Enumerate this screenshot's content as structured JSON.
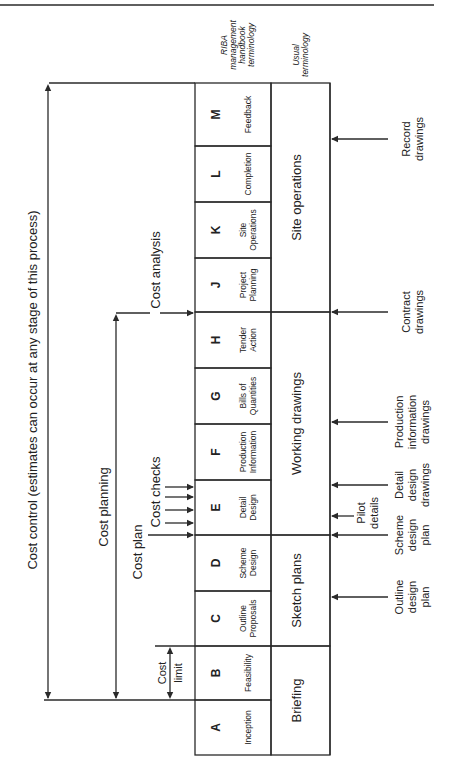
{
  "diagram": {
    "orientation": "rotated-90-ccw",
    "header_labels": {
      "riba": [
        "RIBA",
        "management",
        "handbook",
        "terminology"
      ],
      "usual": [
        "Usual",
        "terminology"
      ]
    },
    "stages": [
      {
        "letter": "A",
        "name": [
          "Inception"
        ],
        "top": 700,
        "bottom": 755
      },
      {
        "letter": "B",
        "name": [
          "Feasibility"
        ],
        "top": 646,
        "bottom": 700
      },
      {
        "letter": "C",
        "name": [
          "Outline",
          "Proposals"
        ],
        "top": 591,
        "bottom": 646
      },
      {
        "letter": "D",
        "name": [
          "Scheme",
          "Design"
        ],
        "top": 535,
        "bottom": 591
      },
      {
        "letter": "E",
        "name": [
          "Detail",
          "Design"
        ],
        "top": 480,
        "bottom": 535
      },
      {
        "letter": "F",
        "name": [
          "Production",
          "Information"
        ],
        "top": 424,
        "bottom": 480
      },
      {
        "letter": "G",
        "name": [
          "Bills of",
          "Quantities"
        ],
        "top": 368,
        "bottom": 424
      },
      {
        "letter": "H",
        "name": [
          "Tender",
          "Action"
        ],
        "top": 312,
        "bottom": 368
      },
      {
        "letter": "J",
        "name": [
          "Project",
          "Planning"
        ],
        "top": 258,
        "bottom": 312
      },
      {
        "letter": "K",
        "name": [
          "Site",
          "Operations"
        ],
        "top": 202,
        "bottom": 258
      },
      {
        "letter": "L",
        "name": [
          "Completion"
        ],
        "top": 146,
        "bottom": 202
      },
      {
        "letter": "M",
        "name": [
          "Feedback"
        ],
        "top": 83,
        "bottom": 146
      }
    ],
    "usual_phases": [
      {
        "label": "Briefing",
        "top": 646,
        "bottom": 755
      },
      {
        "label": "Sketch plans",
        "top": 535,
        "bottom": 646
      },
      {
        "label": "Working drawings",
        "top": 312,
        "bottom": 535
      },
      {
        "label": "Site operations",
        "top": 83,
        "bottom": 312
      }
    ],
    "cost_labels": {
      "cost_control": "Cost control (estimates can occur at any stage of this process)",
      "cost_planning": "Cost planning",
      "cost_analysis": "Cost analysis",
      "cost_plan": "Cost plan",
      "cost_checks": "Cost checks",
      "cost_limit": [
        "Cost",
        "limit"
      ]
    },
    "drawings": [
      {
        "label": [
          "Record",
          "drawings"
        ],
        "y": 139
      },
      {
        "label": [
          "Contract",
          "drawings"
        ],
        "y": 312
      },
      {
        "label": [
          "Production",
          "information",
          "drawings"
        ],
        "y": 422
      },
      {
        "label": [
          "Detail",
          "design",
          "drawings"
        ],
        "y": 485
      },
      {
        "label": [
          "Pilot",
          "details"
        ],
        "y": 516,
        "short": true
      },
      {
        "label": [
          "Scheme",
          "design",
          "plan"
        ],
        "y": 535
      },
      {
        "label": [
          "Outline",
          "design",
          "plan"
        ],
        "y": 597
      }
    ],
    "cost_check_arrows_y": [
      487,
      497,
      510,
      523
    ]
  }
}
